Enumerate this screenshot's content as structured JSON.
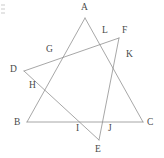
{
  "figure": {
    "canvas": {
      "width": 164,
      "height": 158
    },
    "style": {
      "stroke_color": "#8a8a8a",
      "label_color": "#4a4a4a",
      "background_color": "#ffffff",
      "stroke_width": 0.75,
      "label_font_size": 9.5
    },
    "points": [
      {
        "id": "A",
        "label": "A",
        "x": 85,
        "y": 18,
        "label_x": 81,
        "label_y": 3,
        "kind": "triangle-vertex"
      },
      {
        "id": "B",
        "label": "B",
        "x": 27,
        "y": 122,
        "label_x": 14,
        "label_y": 118,
        "kind": "triangle-vertex"
      },
      {
        "id": "C",
        "label": "C",
        "x": 143,
        "y": 122,
        "label_x": 147,
        "label_y": 118,
        "kind": "triangle-vertex"
      },
      {
        "id": "D",
        "label": "D",
        "x": 24,
        "y": 71,
        "label_x": 10,
        "label_y": 65,
        "kind": "triangle-vertex"
      },
      {
        "id": "E",
        "label": "E",
        "x": 99,
        "y": 140,
        "label_x": 95,
        "label_y": 145,
        "kind": "triangle-vertex"
      },
      {
        "id": "F",
        "label": "F",
        "x": 119,
        "y": 38,
        "label_x": 122,
        "label_y": 26,
        "kind": "triangle-vertex"
      },
      {
        "id": "G",
        "label": "G",
        "x": 57,
        "y": 58,
        "label_x": 46,
        "label_y": 45,
        "kind": "intersection"
      },
      {
        "id": "H",
        "label": "H",
        "x": 40,
        "y": 88,
        "label_x": 29,
        "label_y": 81,
        "kind": "intersection"
      },
      {
        "id": "I",
        "label": "I",
        "x": 80,
        "y": 122,
        "label_x": 76,
        "label_y": 124,
        "kind": "intersection"
      },
      {
        "id": "J",
        "label": "J",
        "x": 107,
        "y": 122,
        "label_x": 108,
        "label_y": 124,
        "kind": "intersection"
      },
      {
        "id": "K",
        "label": "K",
        "x": 124,
        "y": 58,
        "label_x": 126,
        "label_y": 50,
        "kind": "intersection"
      },
      {
        "id": "L",
        "label": "L",
        "x": 105,
        "y": 38,
        "label_x": 102,
        "label_y": 26,
        "kind": "intersection"
      }
    ],
    "edges": [
      {
        "id": "AB",
        "from": "A",
        "to": "B",
        "name": "segment-ab"
      },
      {
        "id": "AC",
        "from": "A",
        "to": "C",
        "name": "segment-ac"
      },
      {
        "id": "BC",
        "from": "B",
        "to": "C",
        "name": "segment-bc"
      },
      {
        "id": "DF",
        "from": "D",
        "to": "F",
        "name": "segment-df"
      },
      {
        "id": "DE",
        "from": "D",
        "to": "E",
        "name": "segment-de"
      },
      {
        "id": "FE",
        "from": "F",
        "to": "E",
        "name": "segment-fe"
      }
    ],
    "triangles": [
      {
        "id": "ABC",
        "vertices": [
          "A",
          "B",
          "C"
        ]
      },
      {
        "id": "DEF",
        "vertices": [
          "D",
          "E",
          "F"
        ]
      }
    ],
    "intersection_map": [
      {
        "point": "G",
        "on_edges": [
          "AB",
          "DF"
        ]
      },
      {
        "point": "H",
        "on_edges": [
          "AB",
          "DE"
        ]
      },
      {
        "point": "I",
        "on_edges": [
          "BC",
          "DE"
        ]
      },
      {
        "point": "J",
        "on_edges": [
          "BC",
          "FE"
        ]
      },
      {
        "point": "K",
        "on_edges": [
          "AC",
          "FE"
        ]
      },
      {
        "point": "L",
        "on_edges": [
          "AC",
          "DF"
        ]
      }
    ]
  }
}
